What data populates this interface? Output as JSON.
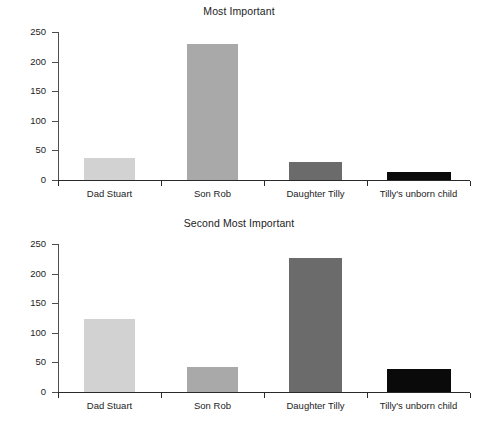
{
  "figure": {
    "background": "#ffffff",
    "width": 478,
    "height": 424
  },
  "chart_data": [
    {
      "type": "bar",
      "title": "Most Important",
      "xlabel": "",
      "ylabel": "",
      "categories": [
        "Dad Stuart",
        "Son Rob",
        "Daughter Tilly",
        "Tilly's unborn child"
      ],
      "values": [
        37,
        230,
        31,
        13
      ],
      "colors": [
        "#d2d2d2",
        "#a9a9a9",
        "#6b6b6b",
        "#0a0a0a"
      ],
      "ylim": [
        0,
        250
      ],
      "yticks": [
        0,
        50,
        100,
        150,
        200,
        250
      ],
      "ytick_labels": [
        "0",
        "50",
        "100",
        "150",
        "200",
        "250"
      ],
      "grid": false,
      "legend": "none"
    },
    {
      "type": "bar",
      "title": "Second Most Important",
      "xlabel": "",
      "ylabel": "",
      "categories": [
        "Dad Stuart",
        "Son Rob",
        "Daughter Tilly",
        "Tilly's unborn child"
      ],
      "values": [
        123,
        43,
        226,
        39
      ],
      "colors": [
        "#d2d2d2",
        "#a9a9a9",
        "#6b6b6b",
        "#0a0a0a"
      ],
      "ylim": [
        0,
        250
      ],
      "yticks": [
        0,
        50,
        100,
        150,
        200,
        250
      ],
      "ytick_labels": [
        "0",
        "50",
        "100",
        "150",
        "200",
        "250"
      ],
      "grid": false,
      "legend": "none"
    }
  ]
}
